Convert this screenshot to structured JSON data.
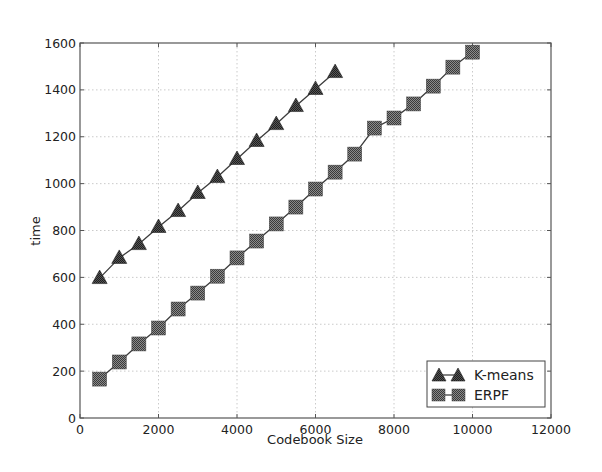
{
  "chart_data": {
    "type": "line",
    "title": "",
    "xlabel": "Codebook Size",
    "ylabel": "time",
    "xlim": [
      0,
      12000
    ],
    "ylim": [
      0,
      1600
    ],
    "xticks": [
      0,
      2000,
      4000,
      6000,
      8000,
      10000,
      12000
    ],
    "yticks": [
      0,
      200,
      400,
      600,
      800,
      1000,
      1200,
      1400,
      1600
    ],
    "grid": true,
    "legend_position": "lower right",
    "series": [
      {
        "name": "K-means",
        "marker": "triangle",
        "color": "#3a3a3a",
        "x": [
          500,
          1000,
          1500,
          2000,
          2500,
          3000,
          3500,
          4000,
          4500,
          5000,
          5500,
          6000,
          6500
        ],
        "y": [
          597,
          683,
          742,
          815,
          883,
          960,
          1028,
          1105,
          1182,
          1254,
          1331,
          1404,
          1476
        ]
      },
      {
        "name": "ERPF",
        "marker": "square",
        "color": "#555555",
        "x": [
          500,
          1000,
          1500,
          2000,
          2500,
          3000,
          3500,
          4000,
          4500,
          5000,
          5500,
          6000,
          6500,
          7000,
          7500,
          8000,
          8500,
          9000,
          9500,
          10000
        ],
        "y": [
          166,
          239,
          316,
          384,
          465,
          533,
          605,
          683,
          755,
          828,
          900,
          977,
          1049,
          1126,
          1237,
          1280,
          1340,
          1416,
          1497,
          1561
        ]
      }
    ]
  },
  "axes": {
    "xlabel": "Codebook Size",
    "ylabel": "time",
    "xtick_labels": [
      "0",
      "2000",
      "4000",
      "6000",
      "8000",
      "10000",
      "12000"
    ],
    "ytick_labels": [
      "0",
      "200",
      "400",
      "600",
      "800",
      "1000",
      "1200",
      "1400",
      "1600"
    ]
  },
  "legend": {
    "items": [
      {
        "label": "K-means",
        "marker": "triangle"
      },
      {
        "label": "ERPF",
        "marker": "square"
      }
    ]
  }
}
